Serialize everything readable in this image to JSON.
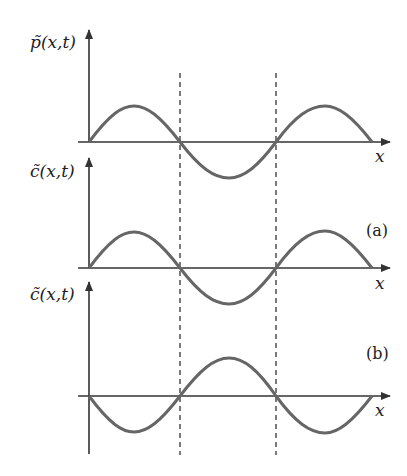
{
  "diagram": {
    "panels": [
      {
        "ylabel": "p̃(x,t)",
        "xlabel": "x",
        "tag": ""
      },
      {
        "ylabel": "c̃(x,t)",
        "xlabel": "x",
        "tag": "(a)"
      },
      {
        "ylabel": "c̃(x,t)",
        "xlabel": "x",
        "tag": "(b)"
      }
    ],
    "colors": {
      "curve": "#666666",
      "axis": "#333333"
    }
  }
}
